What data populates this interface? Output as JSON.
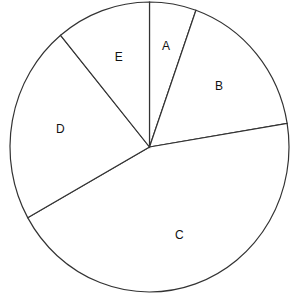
{
  "chart_data": {
    "type": "pie",
    "title": "",
    "start_angle": "12 o'clock",
    "direction": "clockwise",
    "labels": [
      "A",
      "B",
      "C",
      "D",
      "E"
    ],
    "values": [
      5.4,
      17.0,
      44.5,
      22.1,
      11.0
    ],
    "unit": "percent",
    "colors": [
      "#ffffff",
      "#ffffff",
      "#ffffff",
      "#ffffff",
      "#ffffff"
    ],
    "outline_color": "#333333",
    "legend": "none"
  }
}
